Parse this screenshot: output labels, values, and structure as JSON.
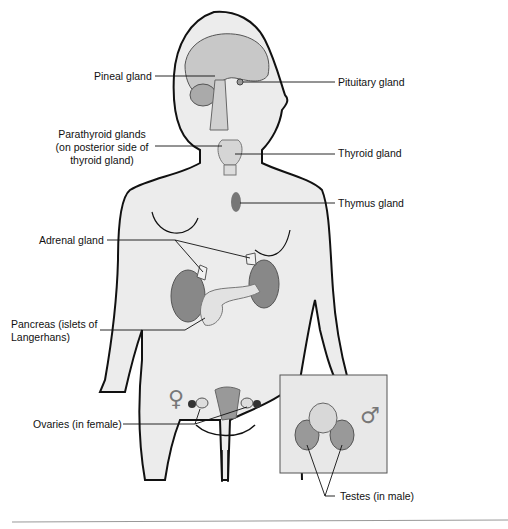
{
  "diagram": {
    "labels": {
      "pineal": "Pineal gland",
      "pituitary": "Pituitary gland",
      "parathyroid_1": "Parathyroid glands",
      "parathyroid_2": "(on posterior side of",
      "parathyroid_3": "thyroid gland)",
      "thyroid": "Thyroid gland",
      "thymus": "Thymus gland",
      "adrenal": "Adrenal gland",
      "pancreas_1": "Pancreas (islets of",
      "pancreas_2": "Langerhans)",
      "ovaries": "Ovaries (in female)",
      "testes": "Testes (in male)"
    },
    "symbols": {
      "female": "♀",
      "male": "♂"
    },
    "colors": {
      "body_fill": "#ececec",
      "organ_fill": "#8c8c8c",
      "outline": "#111111",
      "inset_fill": "#e8e8e8"
    }
  }
}
